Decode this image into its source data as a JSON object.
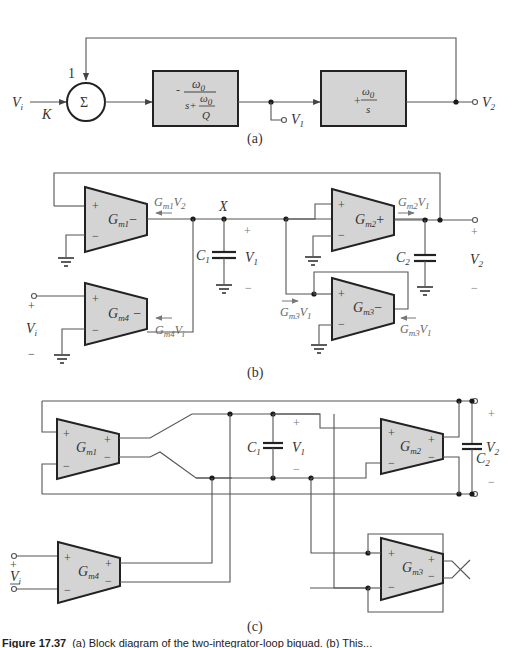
{
  "figure": {
    "part_a": {
      "sub_label": "(a)",
      "input": {
        "name": "V",
        "sub": "i"
      },
      "input_gain": "K",
      "feedback_gain": "1",
      "summer": "Σ",
      "block1": {
        "sign": "-",
        "num": "ω",
        "num_sub": "0",
        "den_s": "s+",
        "den_num": "ω",
        "den_num_sub": "0",
        "den_den": "Q"
      },
      "block2": {
        "sign": "+",
        "num": "ω",
        "num_sub": "0",
        "den": "s"
      },
      "out1": {
        "name": "V",
        "sub": "1"
      },
      "out2": {
        "name": "V",
        "sub": "2"
      }
    },
    "part_b": {
      "sub_label": "(b)",
      "ota1": {
        "name": "G",
        "sub": "m1",
        "out_sign": "−"
      },
      "ota2": {
        "name": "G",
        "sub": "m2",
        "out_sign": "+"
      },
      "ota3": {
        "name": "G",
        "sub": "m3",
        "out_sign": "−"
      },
      "ota4": {
        "name": "G",
        "sub": "m4",
        "out_sign": "−"
      },
      "plus": "+",
      "minus": "−",
      "node_x": "X",
      "c1": {
        "name": "C",
        "sub": "1"
      },
      "c2": {
        "name": "C",
        "sub": "2"
      },
      "v1": {
        "name": "V",
        "sub": "1"
      },
      "v2": {
        "name": "V",
        "sub": "2"
      },
      "vi": {
        "name": "V",
        "sub": "i"
      },
      "i1": {
        "g": "G",
        "gsub": "m1",
        "v": "V",
        "vsub": "2"
      },
      "i2": {
        "g": "G",
        "gsub": "m2",
        "v": "V",
        "vsub": "1"
      },
      "i3a": {
        "g": "G",
        "gsub": "m3",
        "v": "V",
        "vsub": "1"
      },
      "i3b": {
        "g": "G",
        "gsub": "m3",
        "v": "V",
        "vsub": "1"
      },
      "i4": {
        "g": "G",
        "gsub": "m4",
        "v": "V",
        "vsub": "i"
      }
    },
    "part_c": {
      "sub_label": "(c)",
      "ota1": {
        "name": "G",
        "sub": "m1"
      },
      "ota2": {
        "name": "G",
        "sub": "m2"
      },
      "ota3": {
        "name": "G",
        "sub": "m3"
      },
      "ota4": {
        "name": "G",
        "sub": "m4"
      },
      "plus": "+",
      "minus": "−",
      "c1": {
        "name": "C",
        "sub": "1"
      },
      "c2": {
        "name": "C",
        "sub": "2"
      },
      "v1": {
        "name": "V",
        "sub": "1"
      },
      "v2": {
        "name": "V",
        "sub": "2"
      },
      "vi": {
        "name": "V",
        "sub": "i"
      }
    },
    "caption": {
      "label": "Figure 17.37",
      "text": "(a) Block diagram of the two-integrator-loop biquad. (b) This..."
    }
  }
}
